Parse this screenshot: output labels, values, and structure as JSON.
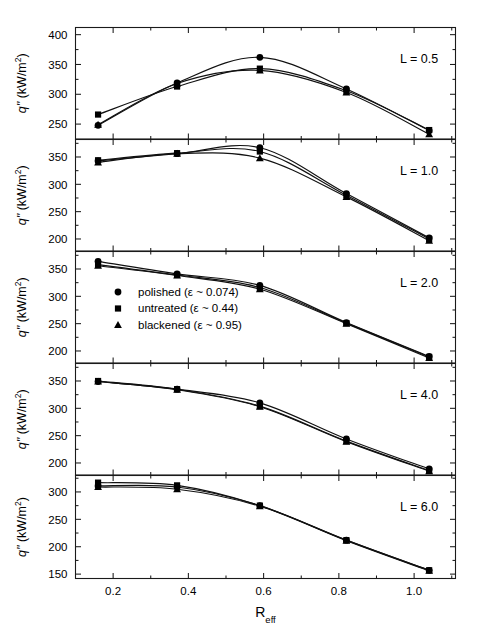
{
  "chart_data": {
    "type": "line",
    "title": "",
    "xlabel": "R_eff",
    "xlabel_base": "R",
    "xlabel_sub": "eff",
    "ylabel": "q\" (kW/m²)",
    "ylabel_parts": {
      "symbol": "q\"",
      "units": " (kW/m",
      "exponent": "2",
      "close": ")"
    },
    "xlim": [
      0.1,
      1.11
    ],
    "xticks": [
      0.2,
      0.4,
      0.6,
      0.8,
      1.0
    ],
    "xticklabels": [
      "0.2",
      "0.4",
      "0.6",
      "0.8",
      "1.0"
    ],
    "x_minor_ticks": [
      0.3,
      0.5,
      0.7,
      0.9,
      1.1
    ],
    "x": [
      0.16,
      0.37,
      0.59,
      0.82,
      1.04
    ],
    "grid": false,
    "legend_position": "panel-3-left",
    "legend": [
      {
        "marker": "circle",
        "label": "polished (ε ~ 0.074)"
      },
      {
        "marker": "square",
        "label": "untreated (ε ~ 0.44)"
      },
      {
        "marker": "triangle",
        "label": "blackened (ε ~ 0.95)"
      }
    ],
    "panels": [
      {
        "id": "panel-L-0.5",
        "label": "L = 0.5",
        "ylim": [
          225,
          412
        ],
        "yticks": [
          250,
          300,
          350,
          400
        ],
        "yticklabels": [
          "250",
          "300",
          "350",
          "400"
        ],
        "y_minor_ticks": [
          275,
          325,
          375
        ],
        "series": [
          {
            "name": "polished (ε ~ 0.074)",
            "marker": "circle",
            "values": [
              248,
              319,
              362,
              309,
              239
            ]
          },
          {
            "name": "untreated (ε ~ 0.44)",
            "marker": "square",
            "values": [
              266,
              313,
              343,
              306,
              240
            ]
          },
          {
            "name": "blackened (ε ~ 0.95)",
            "marker": "triangle",
            "values": [
              249,
              318,
              340,
              303,
              233
            ]
          }
        ]
      },
      {
        "id": "panel-L-1.0",
        "label": "L = 1.0",
        "ylim": [
          178,
          382
        ],
        "yticks": [
          200,
          250,
          300,
          350
        ],
        "yticklabels": [
          "200",
          "250",
          "300",
          "350"
        ],
        "y_minor_ticks": [
          225,
          275,
          325,
          375
        ],
        "series": [
          {
            "name": "polished (ε ~ 0.074)",
            "marker": "circle",
            "values": [
              343,
              356,
              367,
              283,
              202
            ]
          },
          {
            "name": "untreated (ε ~ 0.44)",
            "marker": "square",
            "values": [
              344,
              357,
              360,
              280,
              200
            ]
          },
          {
            "name": "blackened (ε ~ 0.95)",
            "marker": "triangle",
            "values": [
              340,
              356,
              348,
              277,
              197
            ]
          }
        ]
      },
      {
        "id": "panel-L-2.0",
        "label": "L = 2.0",
        "ylim": [
          178,
          382
        ],
        "yticks": [
          200,
          250,
          300,
          350
        ],
        "yticklabels": [
          "200",
          "250",
          "300",
          "350"
        ],
        "y_minor_ticks": [
          225,
          275,
          325,
          375
        ],
        "series": [
          {
            "name": "polished (ε ~ 0.074)",
            "marker": "circle",
            "values": [
              364,
              341,
              320,
              252,
              190
            ]
          },
          {
            "name": "untreated (ε ~ 0.44)",
            "marker": "square",
            "values": [
              358,
              339,
              316,
              251,
              189
            ]
          },
          {
            "name": "blackened (ε ~ 0.95)",
            "marker": "triangle",
            "values": [
              356,
              338,
              313,
              250,
              187
            ]
          }
        ]
      },
      {
        "id": "panel-L-4.0",
        "label": "L = 4.0",
        "ylim": [
          178,
          382
        ],
        "yticks": [
          200,
          250,
          300,
          350
        ],
        "yticklabels": [
          "200",
          "250",
          "300",
          "350"
        ],
        "y_minor_ticks": [
          225,
          275,
          325,
          375
        ],
        "series": [
          {
            "name": "polished (ε ~ 0.074)",
            "marker": "circle",
            "values": [
              349,
              335,
              310,
              244,
              189
            ]
          },
          {
            "name": "untreated (ε ~ 0.44)",
            "marker": "square",
            "values": [
              350,
              335,
              304,
              240,
              186
            ]
          },
          {
            "name": "blackened (ε ~ 0.95)",
            "marker": "triangle",
            "values": [
              349,
              334,
              303,
              239,
              185
            ]
          }
        ]
      },
      {
        "id": "panel-L-6.0",
        "label": "L = 6.0",
        "ylim": [
          142,
          330
        ],
        "yticks": [
          150,
          200,
          250,
          300
        ],
        "yticklabels": [
          "150",
          "200",
          "250",
          "300"
        ],
        "y_minor_ticks": [
          175,
          225,
          275,
          325
        ],
        "series": [
          {
            "name": "polished (ε ~ 0.074)",
            "marker": "circle",
            "values": [
              311,
              309,
              275,
              212,
              157
            ]
          },
          {
            "name": "untreated (ε ~ 0.44)",
            "marker": "square",
            "values": [
              317,
              312,
              275,
              212,
              157
            ]
          },
          {
            "name": "blackened (ε ~ 0.95)",
            "marker": "triangle",
            "values": [
              309,
              305,
              274,
              211,
              156
            ]
          }
        ]
      }
    ]
  }
}
